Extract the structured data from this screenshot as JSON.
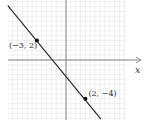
{
  "chart_data": {
    "type": "line",
    "title": "",
    "xlabel": "x",
    "ylabel": "",
    "xlim": [
      -6,
      6
    ],
    "ylim": [
      -6,
      6
    ],
    "grid": true,
    "grid_step": 0.5,
    "series": [
      {
        "name": "line",
        "points": [
          [
            -6,
            5.6
          ],
          [
            3.6,
            -6.1
          ]
        ],
        "color": "#222222"
      }
    ],
    "marked_points": [
      {
        "x": -3,
        "y": 2,
        "label": "(−3, 2)"
      },
      {
        "x": 2,
        "y": -4,
        "label": "(2, −4)"
      }
    ],
    "colors": {
      "grid": "#e6e6e6",
      "axis": "#777777",
      "line": "#222222"
    }
  }
}
